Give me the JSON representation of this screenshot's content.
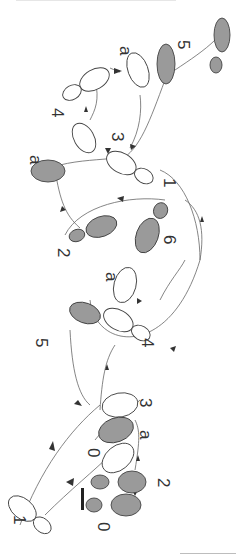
{
  "diagram": {
    "type": "dance-step-footprint-diagram",
    "orientation": "rotated 90 degrees clockwise",
    "colors": {
      "shaded_foot": "#9a9a9a",
      "outline_foot": "#ffffff",
      "stroke": "#444444",
      "path": "#666666",
      "arrow": "#333333"
    },
    "labels": [
      {
        "id": "l-5-top",
        "text": "5",
        "x": 178,
        "y": 40,
        "rot": 90
      },
      {
        "id": "l-a-top",
        "text": "a",
        "x": 120,
        "y": 46,
        "rot": 90
      },
      {
        "id": "l-4-top",
        "text": "4",
        "x": 52,
        "y": 108,
        "rot": 90
      },
      {
        "id": "l-3-top",
        "text": "3",
        "x": 112,
        "y": 132,
        "rot": 90
      },
      {
        "id": "l-a-mid",
        "text": "a",
        "x": 30,
        "y": 155,
        "rot": 90
      },
      {
        "id": "l-1-mid",
        "text": "1",
        "x": 164,
        "y": 178,
        "rot": 90
      },
      {
        "id": "l-2-mid",
        "text": "2",
        "x": 58,
        "y": 248,
        "rot": 90
      },
      {
        "id": "l-6-mid",
        "text": "6",
        "x": 164,
        "y": 235,
        "rot": 90
      },
      {
        "id": "l-a-low",
        "text": "a",
        "x": 106,
        "y": 272,
        "rot": 90
      },
      {
        "id": "l-4-low",
        "text": "4",
        "x": 142,
        "y": 338,
        "rot": 90
      },
      {
        "id": "l-5-low",
        "text": "5",
        "x": 36,
        "y": 338,
        "rot": 90
      },
      {
        "id": "l-3-bot",
        "text": "3",
        "x": 140,
        "y": 398,
        "rot": 90
      },
      {
        "id": "l-a-bot",
        "text": "a",
        "x": 140,
        "y": 430,
        "rot": 90
      },
      {
        "id": "l-0-bot1",
        "text": "0",
        "x": 88,
        "y": 448,
        "rot": 90
      },
      {
        "id": "l-2-bot",
        "text": "2",
        "x": 158,
        "y": 478,
        "rot": 90
      },
      {
        "id": "l-0-bot2",
        "text": "0",
        "x": 98,
        "y": 522,
        "rot": 90
      },
      {
        "id": "l-1-bot",
        "text": "1",
        "x": 14,
        "y": 515,
        "rot": 90
      }
    ]
  }
}
